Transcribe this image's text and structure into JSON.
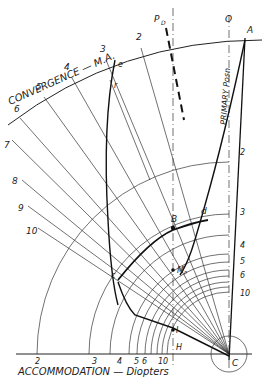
{
  "diagram": {
    "title_convergence": "CONVERGENCE — M.A.",
    "title_accommodation": "ACCOMMODATION — Diopters",
    "convergence_ticks": [
      "2",
      "3",
      "4",
      "5",
      "6",
      "7",
      "8",
      "9",
      "10"
    ],
    "accommodation_ticks": [
      "2",
      "3",
      "4",
      "5",
      "6",
      "10"
    ],
    "right_scale_ticks": [
      "2",
      "3",
      "4",
      "5",
      "6",
      "10"
    ],
    "point_labels": {
      "A": "A",
      "O": "O",
      "PD": "P",
      "PD_sub": "D",
      "B": "B",
      "d": "d",
      "e": "e",
      "r": "r",
      "c": "c",
      "Mp": "M",
      "Mp_sub": "P",
      "I": "I",
      "H": "H",
      "C": "C"
    },
    "primary_position_label": "PRIMARY Posn",
    "colors": {
      "ink": "#222222",
      "background": "#ffffff"
    }
  }
}
